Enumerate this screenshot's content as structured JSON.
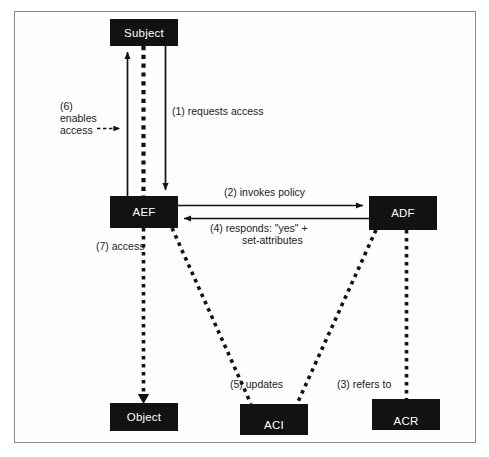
{
  "diagram": {
    "type": "flow-diagram",
    "background_color": "#ffffff",
    "frame_color": "#8b8b8b",
    "node_fill": "#121212",
    "node_text_color": "#ffffff",
    "label_color": "#1a1a1a",
    "nodes": [
      {
        "id": "subject",
        "label": "Subject",
        "x": 110,
        "y": 19,
        "w": 68,
        "h": 27
      },
      {
        "id": "aef",
        "label": "AEF",
        "x": 110,
        "y": 196,
        "w": 68,
        "h": 32
      },
      {
        "id": "adf",
        "label": "ADF",
        "x": 369,
        "y": 196,
        "w": 68,
        "h": 34
      },
      {
        "id": "object",
        "label": "Object",
        "x": 110,
        "y": 403,
        "w": 68,
        "h": 28
      },
      {
        "id": "aci",
        "label": "ACI",
        "x": 240,
        "y": 404,
        "w": 68,
        "h": 31
      },
      {
        "id": "acr",
        "label": "ACR",
        "x": 372,
        "y": 399,
        "w": 68,
        "h": 31
      }
    ],
    "edges": [
      {
        "id": "edge-1",
        "label": "(1) requests access",
        "from": "subject",
        "to": "aef",
        "style": "solid",
        "direction": "down"
      },
      {
        "id": "edge-2",
        "label": "(2) invokes policy",
        "from": "aef",
        "to": "adf",
        "style": "solid",
        "direction": "right"
      },
      {
        "id": "edge-3",
        "label": "(3) refers to",
        "from": "adf",
        "to": "acr",
        "style": "dotted",
        "direction": "down"
      },
      {
        "id": "edge-4",
        "label": "(4) responds: \"yes\" +\nset-attributes",
        "from": "adf",
        "to": "aef",
        "style": "solid",
        "direction": "left"
      },
      {
        "id": "edge-5",
        "label": "(5) updates",
        "from": "aef-and-adf",
        "to": "aci",
        "style": "dotted",
        "direction": "down"
      },
      {
        "id": "edge-6",
        "label": "(6)\nenables\naccess",
        "from": "aef",
        "to": "subject",
        "style": "solid",
        "direction": "up"
      },
      {
        "id": "edge-7",
        "label": "(7) access",
        "from": "aef",
        "to": "object",
        "style": "dotted",
        "direction": "down"
      }
    ],
    "labels": {
      "l1": "(1) requests access",
      "l2": "(2) invokes policy",
      "l3": "(3) refers to",
      "l4_line1": "(4) responds: \"yes\" +",
      "l4_line2": "set-attributes",
      "l5": "(5) updates",
      "l6_line1": "(6)",
      "l6_line2": "enables",
      "l6_line3": "access",
      "l7": "(7) access"
    }
  }
}
